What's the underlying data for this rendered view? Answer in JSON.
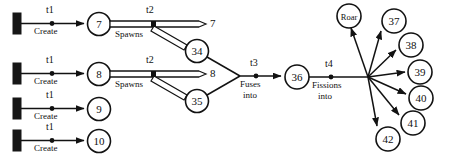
{
  "diagram": {
    "transitions": {
      "t1": {
        "id": "t1",
        "verb_line1": "Create",
        "verb_line2": ""
      },
      "t2": {
        "id": "t2",
        "verb_line1": "Spawns",
        "verb_line2": ""
      },
      "t3": {
        "id": "t3",
        "verb_line1": "Fuses",
        "verb_line2": "into"
      },
      "t4": {
        "id": "t4",
        "verb_line1": "Fissions",
        "verb_line2": "into"
      }
    },
    "rows": [
      {
        "source_bar": "bar-1",
        "transition": "t1",
        "place": "7"
      },
      {
        "source_bar": "bar-2",
        "transition": "t1",
        "place": "8"
      },
      {
        "source_bar": "bar-3",
        "transition": "t1",
        "place": "9"
      },
      {
        "source_bar": "bar-4",
        "transition": "t1",
        "place": "10"
      }
    ],
    "spawn_groups": [
      {
        "from": "7",
        "transition": "t2",
        "passthrough": "7",
        "spawned": "34"
      },
      {
        "from": "8",
        "transition": "t2",
        "passthrough": "8",
        "spawned": "35"
      }
    ],
    "fusion": {
      "inputs": [
        "34",
        "35"
      ],
      "transition": "t3",
      "output": "36"
    },
    "fission": {
      "input": "36",
      "transition": "t4",
      "outputs": [
        "Roar",
        "37",
        "38",
        "39",
        "40",
        "41",
        "42"
      ]
    },
    "places": {
      "p7": "7",
      "p8": "8",
      "p9": "9",
      "p10": "10",
      "p34": "34",
      "p35": "35",
      "p36": "36",
      "pRoar": "Roar",
      "p37": "37",
      "p38": "38",
      "p39": "39",
      "p40": "40",
      "p41": "41",
      "p42": "42"
    },
    "passthrough_labels": {
      "top": "7",
      "bottom": "8"
    },
    "colors": {
      "ink": "#121212",
      "paper": "#ffffff"
    }
  }
}
